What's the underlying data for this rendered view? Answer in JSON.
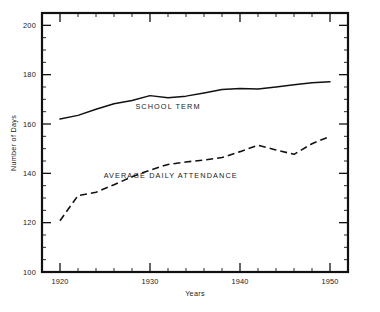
{
  "chart_data": {
    "type": "line",
    "title": "",
    "xlabel": "Years",
    "ylabel": "Number of Days",
    "xlim": [
      1918,
      1952
    ],
    "ylim": [
      100,
      205
    ],
    "grid": false,
    "legend_position": "inline-annotation",
    "x_major_ticks": [
      1920,
      1930,
      1940,
      1950
    ],
    "x_major_tick_labels": [
      "1920",
      "1930",
      "1940",
      "1950"
    ],
    "x_minor_tick_interval": 2,
    "y_major_ticks": [
      100,
      120,
      140,
      160,
      180,
      200
    ],
    "y_major_tick_labels": [
      "100",
      "120",
      "140",
      "160",
      "180",
      "200"
    ],
    "y_minor_tick_interval": 5,
    "x": [
      1920,
      1922,
      1924,
      1926,
      1928,
      1930,
      1932,
      1934,
      1936,
      1938,
      1940,
      1942,
      1944,
      1946,
      1948,
      1950
    ],
    "series": [
      {
        "name": "SCHOOL TERM",
        "style": "solid",
        "color": "#111111",
        "values": [
          162.0,
          163.5,
          166.0,
          168.2,
          169.5,
          171.5,
          170.6,
          171.3,
          172.6,
          174.0,
          174.4,
          174.2,
          175.0,
          175.9,
          176.7,
          177.1
        ],
        "label_x": 1932.0,
        "label_y": 166.2
      },
      {
        "name": "AVERAGE DAILY ATTENDANCE",
        "style": "dashed",
        "color": "#111111",
        "values": [
          120.8,
          131.0,
          132.3,
          135.4,
          138.6,
          141.3,
          143.6,
          144.6,
          145.4,
          146.4,
          148.8,
          151.4,
          149.5,
          147.7,
          152.0,
          155.0
        ],
        "label_x": 1932.3,
        "label_y": 138.0
      }
    ],
    "annotations": [
      {
        "text": "SCHOOL TERM",
        "x": 1932.0,
        "y": 166.2
      },
      {
        "text": "AVERAGE DAILY ATTENDANCE",
        "x": 1932.3,
        "y": 138.0
      }
    ]
  },
  "plot_geometry": {
    "left": 42,
    "top": 13,
    "right": 348,
    "bottom": 272
  }
}
